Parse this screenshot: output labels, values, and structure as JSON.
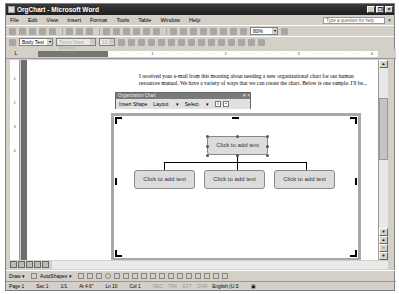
{
  "window": {
    "title": "OrgChart - Microsoft Word"
  },
  "menu": [
    "File",
    "Edit",
    "View",
    "Insert",
    "Format",
    "Tools",
    "Table",
    "Window",
    "Help"
  ],
  "help_box": {
    "placeholder": "Type a question for help"
  },
  "toolbar": {
    "zoom": "80%"
  },
  "formatting": {
    "style": "Body Text",
    "font": "Times New Roman",
    "size": "10"
  },
  "ruler": {
    "ticks": "· · · 1 · · · · 2 · · · · 3 · · · · 4 · · · · 5 · · · · 6 · ·"
  },
  "document": {
    "paragraph": "I received your e-mail from this morning about needing a new organizational chart for our human resources manual. We have a variety of ways that we can create the chart. Below is one sample. I'll be..."
  },
  "orgchart_toolbar": {
    "title": "Organization Chart",
    "insert_shape": "Insert Shape",
    "layout": "Layout",
    "select": "Select"
  },
  "orgchart": {
    "top": "Click to add text",
    "children": [
      "Click to add text",
      "Click to add text",
      "Click to add text"
    ]
  },
  "drawbar": {
    "draw": "Draw",
    "autoshapes": "AutoShapes"
  },
  "status": {
    "page": "Page 1",
    "sec": "Sec 1",
    "pages": "1/1",
    "at": "At 4.6\"",
    "ln": "Ln 10",
    "col": "Col 1",
    "rec": "REC",
    "trk": "TRK",
    "ext": "EXT",
    "ovr": "OVR",
    "lang": "English (U.S"
  }
}
